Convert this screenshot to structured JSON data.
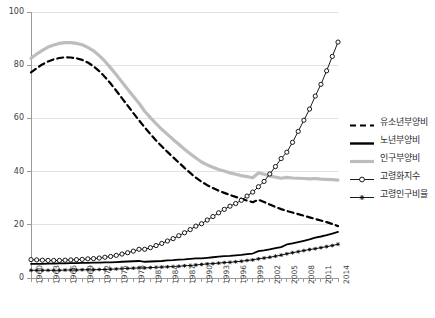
{
  "chart_data": {
    "type": "line",
    "title": "",
    "xlabel": "",
    "ylabel": "",
    "ylim": [
      0,
      100
    ],
    "yticks": [
      0,
      20,
      40,
      60,
      80,
      100
    ],
    "grid": true,
    "legend_position": "right",
    "x": [
      1960,
      1961,
      1962,
      1963,
      1964,
      1965,
      1966,
      1967,
      1968,
      1969,
      1970,
      1971,
      1972,
      1973,
      1974,
      1975,
      1976,
      1977,
      1978,
      1979,
      1980,
      1981,
      1982,
      1983,
      1984,
      1985,
      1986,
      1987,
      1988,
      1989,
      1990,
      1991,
      1992,
      1993,
      1994,
      1995,
      1996,
      1997,
      1998,
      1999,
      2000,
      2001,
      2002,
      2003,
      2004,
      2005,
      2006,
      2007,
      2008,
      2009,
      2010,
      2011,
      2012,
      2013,
      2014
    ],
    "xtick_labels": [
      "1960",
      "1963",
      "1966",
      "1969",
      "1972",
      "1975",
      "1978",
      "1981",
      "1984",
      "1987",
      "1990",
      "1993",
      "1996",
      "1999",
      "2002",
      "2005",
      "2008",
      "2011",
      "2014"
    ],
    "xtick_interval_years": 3,
    "series": [
      {
        "name": "유소년부양비",
        "style": "dashed",
        "color": "#000000",
        "values": [
          77.3,
          78.9,
          80.3,
          81.4,
          82.2,
          82.7,
          83.0,
          82.9,
          82.6,
          82.0,
          81.0,
          79.6,
          77.8,
          75.6,
          73.1,
          70.4,
          67.6,
          64.8,
          62.0,
          59.3,
          56.6,
          54.1,
          51.7,
          49.5,
          47.4,
          45.4,
          43.4,
          41.4,
          39.5,
          37.7,
          36.2,
          34.9,
          33.8,
          32.8,
          32.0,
          31.2,
          30.5,
          29.8,
          29.1,
          28.5,
          29.4,
          28.6,
          27.6,
          26.7,
          25.9,
          25.2,
          24.6,
          24.0,
          23.4,
          22.8,
          22.2,
          21.6,
          21.0,
          20.3,
          19.5
        ]
      },
      {
        "name": "노년부양비",
        "style": "solid",
        "color": "#000000",
        "values": [
          5.3,
          5.3,
          5.3,
          5.4,
          5.4,
          5.5,
          5.5,
          5.6,
          5.6,
          5.7,
          5.7,
          5.8,
          5.8,
          5.9,
          5.9,
          6.0,
          6.1,
          6.2,
          6.3,
          6.4,
          6.1,
          6.2,
          6.3,
          6.4,
          6.6,
          6.7,
          6.9,
          7.0,
          7.2,
          7.4,
          7.4,
          7.6,
          7.8,
          8.0,
          8.2,
          8.3,
          8.5,
          8.7,
          9.0,
          9.2,
          10.1,
          10.4,
          10.8,
          11.2,
          11.6,
          12.6,
          13.0,
          13.5,
          14.0,
          14.5,
          15.2,
          15.6,
          16.1,
          16.7,
          17.3
        ]
      },
      {
        "name": "인구부양비",
        "style": "solid-thick",
        "color": "#bdbdbd",
        "values": [
          82.6,
          84.2,
          85.6,
          86.8,
          87.6,
          88.2,
          88.5,
          88.5,
          88.2,
          87.7,
          86.7,
          85.4,
          83.6,
          81.5,
          79.0,
          76.4,
          73.7,
          71.0,
          68.3,
          65.7,
          62.7,
          60.3,
          58.0,
          55.9,
          54.0,
          52.1,
          50.3,
          48.4,
          46.7,
          45.1,
          43.6,
          42.5,
          41.6,
          40.8,
          40.2,
          39.5,
          39.0,
          38.5,
          38.1,
          37.7,
          39.5,
          39.0,
          38.4,
          37.9,
          37.5,
          37.8,
          37.6,
          37.5,
          37.4,
          37.3,
          37.4,
          37.2,
          37.1,
          37.0,
          36.8
        ]
      },
      {
        "name": "고령화지수",
        "style": "line-circle",
        "color": "#000000",
        "values": [
          6.9,
          6.8,
          6.7,
          6.6,
          6.6,
          6.6,
          6.7,
          6.8,
          6.9,
          7.0,
          7.2,
          7.3,
          7.5,
          7.8,
          8.1,
          8.5,
          9.0,
          9.5,
          10.1,
          10.8,
          10.8,
          11.4,
          12.2,
          13.0,
          13.9,
          14.8,
          15.9,
          17.0,
          18.2,
          19.5,
          20.4,
          21.8,
          23.1,
          24.5,
          25.8,
          27.0,
          28.0,
          29.2,
          30.8,
          32.3,
          34.3,
          36.3,
          39.1,
          41.9,
          44.9,
          47.3,
          51.0,
          55.1,
          59.3,
          63.5,
          68.4,
          72.8,
          77.9,
          83.3,
          88.7
        ]
      },
      {
        "name": "고령인구비율",
        "style": "line-star",
        "color": "#000000",
        "values": [
          2.9,
          2.9,
          2.9,
          2.9,
          2.9,
          2.9,
          3.0,
          3.0,
          3.0,
          3.1,
          3.1,
          3.1,
          3.2,
          3.2,
          3.3,
          3.4,
          3.5,
          3.6,
          3.7,
          3.8,
          3.8,
          3.9,
          4.0,
          4.1,
          4.2,
          4.3,
          4.4,
          4.6,
          4.7,
          4.9,
          5.1,
          5.3,
          5.4,
          5.6,
          5.8,
          5.9,
          6.1,
          6.3,
          6.6,
          6.8,
          7.2,
          7.5,
          7.8,
          8.2,
          8.6,
          9.1,
          9.5,
          9.9,
          10.3,
          10.7,
          11.0,
          11.4,
          11.8,
          12.2,
          12.7
        ]
      }
    ]
  },
  "legend": {
    "items": [
      {
        "label": "유소년부양비",
        "marker": "dashed-line-marker"
      },
      {
        "label": "노년부양비",
        "marker": "solid-line-marker"
      },
      {
        "label": "인구부양비",
        "marker": "gray-line-marker"
      },
      {
        "label": "고령화지수",
        "marker": "circle-line-marker"
      },
      {
        "label": "고령인구비율",
        "marker": "star-line-marker"
      }
    ]
  },
  "colors": {
    "youth": "#000000",
    "old": "#000000",
    "total": "#bdbdbd",
    "aging_index": "#000000",
    "elderly_ratio": "#000000",
    "grid": "#e3e3e3",
    "axis": "#9a9a9a",
    "text": "#404040"
  }
}
